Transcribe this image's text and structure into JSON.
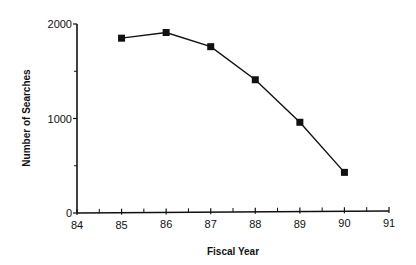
{
  "chart_data": {
    "type": "line",
    "title": "",
    "xlabel": "Fiscal Year",
    "ylabel": "Number of Searches",
    "x": [
      85,
      86,
      87,
      88,
      89,
      90
    ],
    "series": [
      {
        "name": "Number of Searches",
        "values": [
          1850,
          1910,
          1760,
          1410,
          960,
          430
        ],
        "marker": "square",
        "color": "#111111"
      }
    ],
    "xlim": [
      84,
      91
    ],
    "ylim": [
      0,
      2000
    ],
    "x_ticks": [
      84,
      85,
      86,
      87,
      88,
      89,
      90,
      91
    ],
    "x_tick_labels": [
      "84",
      "85",
      "86",
      "87",
      "88",
      "89",
      "90",
      "91"
    ],
    "x_minor_ticks": true,
    "y_ticks": [
      0,
      1000,
      2000
    ],
    "y_tick_labels": [
      "0",
      "1000",
      "2000"
    ],
    "y_minor_ticks": [
      500,
      1500
    ],
    "grid": false,
    "legend": null
  },
  "labels": {
    "xlabel": "Fiscal Year",
    "ylabel": "Number of Searches"
  }
}
